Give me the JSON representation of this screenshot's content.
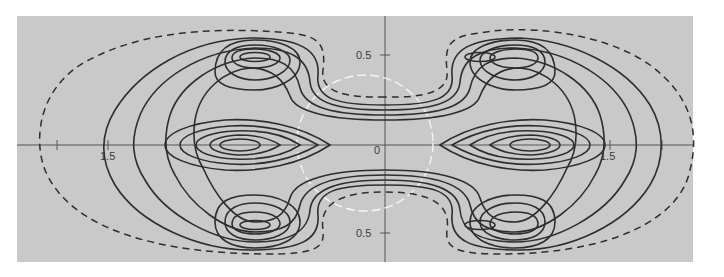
{
  "figure": {
    "background_color": "#c9c9c9",
    "contour_color": "#2e2e2e",
    "boundary_style": "dashed",
    "reference_circle_color": "#f4f4f4"
  },
  "axes": {
    "origin_label": "0",
    "x_tick_labels": [
      {
        "side": "left",
        "label": "1.5"
      },
      {
        "side": "right",
        "label": "1.5"
      }
    ],
    "y_tick_labels": [
      {
        "side": "top",
        "label": "0.5"
      },
      {
        "side": "bottom",
        "label": "0.5"
      }
    ]
  },
  "features": {
    "peaks": [
      {
        "name": "upper-left",
        "position": "(-0.75, 0.5)"
      },
      {
        "name": "upper-right",
        "position": "(0.75, 0.5)"
      },
      {
        "name": "middle-left",
        "position": "(-1.0, 0)"
      },
      {
        "name": "middle-right",
        "position": "(1.0, 0)"
      },
      {
        "name": "lower-left",
        "position": "(-0.75, -0.5)"
      },
      {
        "name": "lower-right",
        "position": "(0.75, -0.5)"
      }
    ],
    "outer_boundary": "dashed ellipse-like contour",
    "center_circle": "white dashed circle around origin"
  }
}
